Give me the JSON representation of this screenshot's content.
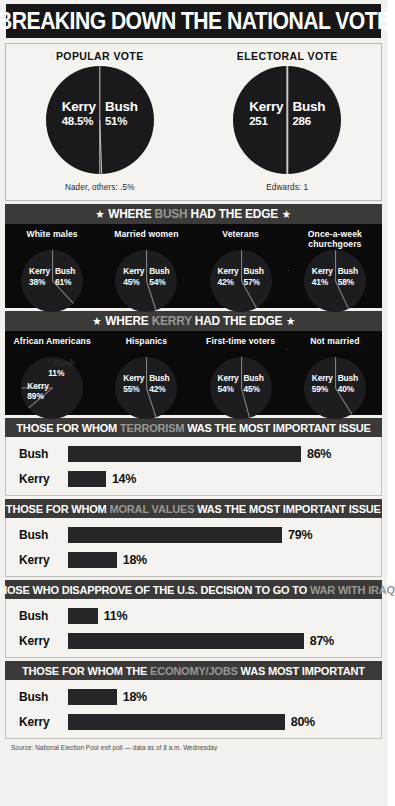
{
  "title": "BREAKING DOWN THE NATIONAL VOTE",
  "top": {
    "popular": {
      "heading": "POPULAR VOTE",
      "kerry_name": "Kerry",
      "kerry_value": "48.5%",
      "bush_name": "Bush",
      "bush_value": "51%",
      "note": "Nader, others: .5%"
    },
    "electoral": {
      "heading": "ELECTORAL VOTE",
      "kerry_name": "Kerry",
      "kerry_value": "251",
      "bush_name": "Bush",
      "bush_value": "286",
      "note": "Edwards: 1"
    }
  },
  "bush_edge": {
    "band_pre": "WHERE ",
    "band_hl": "BUSH",
    "band_post": " HAD THE EDGE",
    "star": "★",
    "groups": [
      {
        "label": "White males",
        "kerry_name": "Kerry",
        "kerry_value": "38%",
        "bush_name": "Bush",
        "bush_value": "61%"
      },
      {
        "label": "Married women",
        "kerry_name": "Kerry",
        "kerry_value": "45%",
        "bush_name": "Bush",
        "bush_value": "54%"
      },
      {
        "label": "Veterans",
        "kerry_name": "Kerry",
        "kerry_value": "42%",
        "bush_name": "Bush",
        "bush_value": "57%"
      },
      {
        "label": "Once-a-week churchgoers",
        "kerry_name": "Kerry",
        "kerry_value": "41%",
        "bush_name": "Bush",
        "bush_value": "58%"
      }
    ]
  },
  "kerry_edge": {
    "band_pre": "WHERE ",
    "band_hl": "KERRY",
    "band_post": " HAD THE EDGE",
    "star": "★",
    "groups": [
      {
        "label": "African Americans",
        "kerry_name": "Kerry",
        "kerry_value": "89%",
        "bush_name": "Bush",
        "bush_value": "11%"
      },
      {
        "label": "Hispanics",
        "kerry_name": "Kerry",
        "kerry_value": "55%",
        "bush_name": "Bush",
        "bush_value": "42%"
      },
      {
        "label": "First-time voters",
        "kerry_name": "Kerry",
        "kerry_value": "54%",
        "bush_name": "Bush",
        "bush_value": "45%"
      },
      {
        "label": "Not married",
        "kerry_name": "Kerry",
        "kerry_value": "59%",
        "bush_name": "Bush",
        "bush_value": "40%"
      }
    ]
  },
  "issues": [
    {
      "band_pre": "THOSE FOR WHOM ",
      "band_hl": "TERRORISM",
      "band_post": " WAS THE MOST IMPORTANT ISSUE",
      "bars": [
        {
          "label": "Bush",
          "value": "86%",
          "pct": 86
        },
        {
          "label": "Kerry",
          "value": "14%",
          "pct": 14
        }
      ]
    },
    {
      "band_pre": "THOSE FOR WHOM ",
      "band_hl": "MORAL VALUES",
      "band_post": " WAS THE MOST IMPORTANT ISSUE",
      "bars": [
        {
          "label": "Bush",
          "value": "79%",
          "pct": 79
        },
        {
          "label": "Kerry",
          "value": "18%",
          "pct": 18
        }
      ]
    },
    {
      "band_pre": "THOSE WHO DISAPPROVE OF THE U.S. DECISION TO GO TO ",
      "band_hl": "WAR WITH IRAQ",
      "band_post": "",
      "bars": [
        {
          "label": "Bush",
          "value": "11%",
          "pct": 11
        },
        {
          "label": "Kerry",
          "value": "87%",
          "pct": 87
        }
      ]
    },
    {
      "band_pre": "THOSE FOR WHOM THE ",
      "band_hl": "ECONOMY/JOBS",
      "band_post": " WAS MOST IMPORTANT",
      "bars": [
        {
          "label": "Bush",
          "value": "18%",
          "pct": 18
        },
        {
          "label": "Kerry",
          "value": "80%",
          "pct": 80
        }
      ]
    }
  ],
  "source": "Source: National Election Pool exit poll — data as of 8 a.m. Wednesday",
  "chart_data": [
    {
      "type": "pie",
      "title": "POPULAR VOTE",
      "labels": [
        "Kerry",
        "Bush",
        "Nader, others"
      ],
      "values": [
        48.5,
        51,
        0.5
      ],
      "value_labels": [
        "48.5%",
        "51%",
        ".5%"
      ],
      "annotation": "Nader, others: .5%"
    },
    {
      "type": "pie",
      "title": "ELECTORAL VOTE",
      "labels": [
        "Kerry",
        "Bush",
        "Edwards"
      ],
      "values": [
        251,
        286,
        1
      ],
      "value_labels": [
        "251",
        "286",
        "1"
      ],
      "annotation": "Edwards: 1"
    },
    {
      "type": "pie",
      "title": "WHERE BUSH HAD THE EDGE",
      "categories": [
        "White males",
        "Married women",
        "Veterans",
        "Once-a-week churchgoers"
      ],
      "series": [
        {
          "name": "Kerry",
          "values": [
            38,
            45,
            42,
            41
          ]
        },
        {
          "name": "Bush",
          "values": [
            61,
            54,
            57,
            58
          ]
        }
      ]
    },
    {
      "type": "pie",
      "title": "WHERE KERRY HAD THE EDGE",
      "categories": [
        "African Americans",
        "Hispanics",
        "First-time voters",
        "Not married"
      ],
      "series": [
        {
          "name": "Kerry",
          "values": [
            89,
            55,
            54,
            59
          ]
        },
        {
          "name": "Bush",
          "values": [
            11,
            42,
            45,
            40
          ]
        }
      ]
    },
    {
      "type": "bar",
      "title": "THOSE FOR WHOM TERRORISM WAS THE MOST IMPORTANT ISSUE",
      "categories": [
        "Bush",
        "Kerry"
      ],
      "values": [
        86,
        14
      ],
      "xlabel": "",
      "ylabel": "",
      "xlim": [
        0,
        100
      ]
    },
    {
      "type": "bar",
      "title": "THOSE FOR WHOM MORAL VALUES WAS THE MOST IMPORTANT ISSUE",
      "categories": [
        "Bush",
        "Kerry"
      ],
      "values": [
        79,
        18
      ],
      "xlabel": "",
      "ylabel": "",
      "xlim": [
        0,
        100
      ]
    },
    {
      "type": "bar",
      "title": "THOSE WHO DISAPPROVE OF THE U.S. DECISION TO GO TO WAR WITH IRAQ",
      "categories": [
        "Bush",
        "Kerry"
      ],
      "values": [
        11,
        87
      ],
      "xlabel": "",
      "ylabel": "",
      "xlim": [
        0,
        100
      ]
    },
    {
      "type": "bar",
      "title": "THOSE FOR WHOM THE ECONOMY/JOBS WAS MOST IMPORTANT",
      "categories": [
        "Bush",
        "Kerry"
      ],
      "values": [
        18,
        80
      ],
      "xlabel": "",
      "ylabel": "",
      "xlim": [
        0,
        100
      ]
    }
  ]
}
